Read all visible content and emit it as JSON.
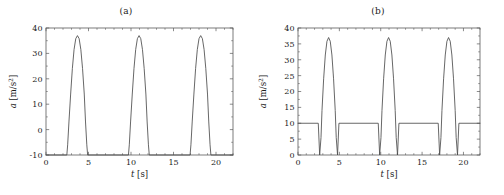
{
  "figure": {
    "panels": [
      {
        "title": "(a)",
        "xlabel": "t [s]",
        "ylabel": "a [m/s2]",
        "ylabel_var": "a",
        "ylabel_unit": "[m/s",
        "ylabel_exp": "2",
        "xlabel_var": "t",
        "xlabel_unit": "[s]"
      },
      {
        "title": "(b)",
        "xlabel": "t [s]",
        "ylabel": "a [m/s2]",
        "ylabel_var": "a",
        "ylabel_unit": "[m/s",
        "ylabel_exp": "2",
        "xlabel_var": "t",
        "xlabel_unit": "[s]"
      }
    ]
  },
  "chart_data": [
    {
      "type": "line",
      "title": "(a)",
      "xlabel": "t [s]",
      "ylabel": "a [m/s^2]",
      "xlim": [
        0,
        22
      ],
      "ylim": [
        -10,
        40
      ],
      "xticks": [
        0,
        5,
        10,
        15,
        20
      ],
      "yticks": [
        -10,
        0,
        10,
        20,
        30,
        40
      ],
      "xtick_labels": [
        "0",
        "5",
        "10",
        "15",
        "20"
      ],
      "ytick_labels": [
        "-10",
        "0",
        "10",
        "20",
        "30",
        "40"
      ],
      "grid": false,
      "legend": null,
      "baseline": -10,
      "peak_value": 37,
      "period": 7.2,
      "pulse_centers": [
        3.7,
        10.95,
        18.2
      ],
      "series": [
        {
          "name": "acceleration",
          "color": "#4c4c4c",
          "x": [
            0,
            2.45,
            2.55,
            2.7,
            2.9,
            3.1,
            3.3,
            3.5,
            3.7,
            3.9,
            4.1,
            4.3,
            4.5,
            4.65,
            4.8,
            4.9,
            9.7,
            9.8,
            9.95,
            10.15,
            10.35,
            10.55,
            10.75,
            10.95,
            11.15,
            11.35,
            11.55,
            11.75,
            11.9,
            12.05,
            12.15,
            16.95,
            17.05,
            17.2,
            17.4,
            17.6,
            17.8,
            18.0,
            18.2,
            18.4,
            18.6,
            18.8,
            19.0,
            19.15,
            19.3,
            19.4,
            22
          ],
          "y": [
            -10,
            -10,
            -6,
            3,
            14,
            24,
            31.5,
            35.8,
            37,
            35.8,
            31.5,
            24,
            14,
            3,
            -6,
            -10,
            -10,
            -6,
            3,
            14,
            24,
            31.5,
            35.8,
            37,
            35.8,
            31.5,
            24,
            14,
            3,
            -6,
            -10,
            -10,
            -6,
            3,
            14,
            24,
            31.5,
            35.8,
            37,
            35.8,
            31.5,
            24,
            14,
            3,
            -6,
            -10,
            -10
          ]
        }
      ]
    },
    {
      "type": "line",
      "title": "(b)",
      "xlabel": "t [s]",
      "ylabel": "a [m/s^2]",
      "xlim": [
        0,
        22
      ],
      "ylim": [
        0,
        40
      ],
      "xticks": [
        0,
        5,
        10,
        15,
        20
      ],
      "yticks": [
        0,
        5,
        10,
        15,
        20,
        25,
        30,
        35,
        40
      ],
      "xtick_labels": [
        "0",
        "5",
        "10",
        "15",
        "20"
      ],
      "ytick_labels": [
        "0",
        "5",
        "10",
        "15",
        "20",
        "25",
        "30",
        "35",
        "40"
      ],
      "grid": false,
      "legend": null,
      "baseline": 10,
      "notch_value": 0,
      "peak_value": 37,
      "period": 7.2,
      "pulse_centers": [
        3.7,
        10.95,
        18.2
      ],
      "series": [
        {
          "name": "acceleration",
          "color": "#4c4c4c",
          "x": [
            0,
            2.45,
            2.62,
            2.78,
            2.9,
            3.1,
            3.3,
            3.5,
            3.7,
            3.9,
            4.1,
            4.3,
            4.5,
            4.62,
            4.78,
            4.95,
            9.7,
            9.87,
            10.03,
            10.15,
            10.35,
            10.55,
            10.75,
            10.95,
            11.15,
            11.35,
            11.55,
            11.75,
            11.87,
            12.03,
            12.2,
            16.95,
            17.12,
            17.28,
            17.4,
            17.6,
            17.8,
            18.0,
            18.2,
            18.4,
            18.6,
            18.8,
            19.0,
            19.12,
            19.28,
            19.45,
            22
          ],
          "y": [
            10,
            10,
            0,
            5.5,
            14,
            24,
            31.5,
            35.8,
            37,
            35.8,
            31.5,
            24,
            14,
            5.5,
            0,
            10,
            10,
            0,
            5.5,
            14,
            24,
            31.5,
            35.8,
            37,
            35.8,
            31.5,
            24,
            14,
            5.5,
            0,
            10,
            10,
            0,
            5.5,
            14,
            24,
            31.5,
            35.8,
            37,
            35.8,
            31.5,
            24,
            14,
            5.5,
            0,
            10,
            10
          ]
        }
      ]
    }
  ]
}
